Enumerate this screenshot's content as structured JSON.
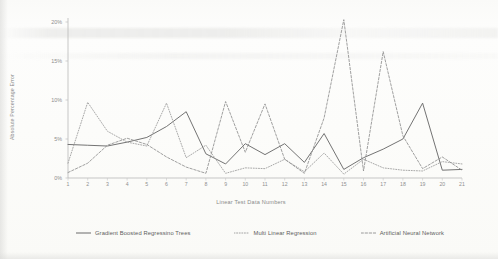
{
  "chart_data": {
    "type": "line",
    "title": "",
    "xlabel": "Linear Test Data Numbers",
    "ylabel": "Absolute Percentage Error",
    "x": [
      1,
      2,
      3,
      4,
      5,
      6,
      7,
      8,
      9,
      10,
      11,
      12,
      13,
      14,
      15,
      16,
      17,
      18,
      19,
      20,
      21
    ],
    "xtick_labels": [
      "1",
      "2",
      "3",
      "4",
      "5",
      "6",
      "7",
      "8",
      "9",
      "10",
      "11",
      "12",
      "13",
      "14",
      "15",
      "16",
      "17",
      "18",
      "19",
      "20",
      "21"
    ],
    "ytick_labels": [
      "0%",
      "5%",
      "10%",
      "15%",
      "20%"
    ],
    "ytick_values": [
      0,
      5,
      10,
      15,
      20
    ],
    "ylim": [
      0,
      20
    ],
    "xlim": [
      1,
      21
    ],
    "grid": false,
    "legend_position": "bottom",
    "series": [
      {
        "name": "Gradient Boosted Regressino Trees",
        "style": "solid",
        "color": "#6b6b6b",
        "values": [
          4.3,
          4.2,
          4.1,
          4.6,
          5.2,
          6.6,
          8.5,
          3.1,
          1.8,
          4.4,
          3.0,
          4.4,
          2.0,
          5.7,
          1.1,
          2.6,
          3.7,
          5.0,
          9.6,
          1.0,
          1.1
        ]
      },
      {
        "name": "Multi Linear Regression",
        "style": "dotted",
        "color": "#9a9a9a",
        "values": [
          1.9,
          9.7,
          6.0,
          4.6,
          4.1,
          9.6,
          2.6,
          4.2,
          0.6,
          1.3,
          1.2,
          2.4,
          0.8,
          3.2,
          0.5,
          2.4,
          1.3,
          1.0,
          0.9,
          2.1,
          1.8
        ]
      },
      {
        "name": "Artificial Neural Network",
        "style": "dashed",
        "color": "#8f8f8f",
        "values": [
          0.7,
          1.9,
          4.2,
          5.1,
          4.3,
          2.7,
          1.4,
          0.6,
          9.8,
          3.3,
          9.5,
          2.4,
          0.6,
          7.7,
          20.3,
          0.9,
          16.2,
          5.4,
          1.2,
          2.7,
          1.0
        ]
      }
    ]
  },
  "axes": {
    "y_title": "Absolute Percentage Error",
    "x_title": "Linear Test Data Numbers"
  },
  "legend": {
    "items": [
      {
        "label": "Gradient Boosted Regressino Trees",
        "style": "solid"
      },
      {
        "label": "Multi Linear Regression",
        "style": "dotted"
      },
      {
        "label": "Artificial Neural Network",
        "style": "dashed"
      }
    ]
  }
}
